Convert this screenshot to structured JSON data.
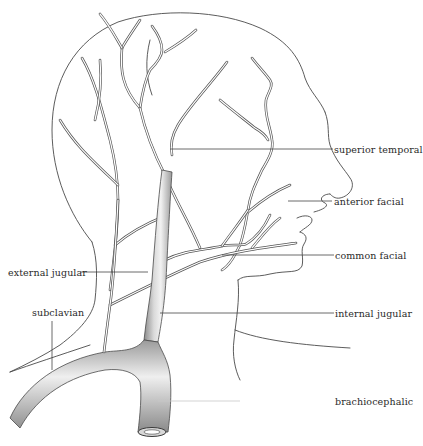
{
  "figure": {
    "colors": {
      "line": "#4a4a4a",
      "vessel_fill": "#e6e6e6",
      "vessel_shade": "#9a9a9a",
      "text": "#2a2a2a",
      "background": "#ffffff"
    }
  },
  "labels": {
    "superior_temporal": "superior temporal",
    "anterior_facial": "anterior facial",
    "common_facial": "common facial",
    "external_jugular": "external jugular",
    "subclavian": "subclavian",
    "internal_jugular": "internal jugular",
    "brachiocephalic": "brachiocephalic"
  }
}
